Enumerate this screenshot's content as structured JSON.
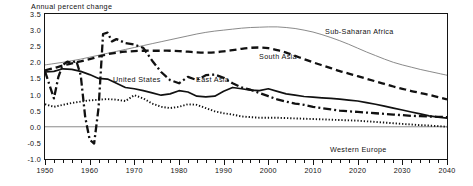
{
  "axis_title": "Annual percent change",
  "yticks": [
    "3.5",
    "3.0",
    "2.5",
    "2.0",
    "1.5",
    "1.0",
    "0.5",
    "0.0",
    "-0.5",
    "-1.0"
  ],
  "xticks": [
    "1950",
    "1960",
    "1970",
    "1980",
    "1990",
    "2000",
    "2010",
    "2020",
    "2030",
    "2040"
  ],
  "labels": {
    "sub_saharan_africa": "Sub-Saharan Africa",
    "south_asia": "South Asia",
    "east_asia": "East Asia",
    "united_states": "United States",
    "western_europe": "Western Europe"
  },
  "colors": {
    "frame": "#141414",
    "zero_line": "#8a8a8a",
    "sub_saharan_africa": "#7d7d7d",
    "south_asia": "#111111",
    "east_asia": "#111111",
    "united_states": "#111111",
    "western_europe": "#111111"
  },
  "chart_data": {
    "type": "line",
    "title": "",
    "xlabel": "",
    "ylabel": "Annual percent change",
    "xlim": [
      1950,
      2040
    ],
    "ylim": [
      -1.0,
      3.5
    ],
    "ytick_values": [
      3.5,
      3.0,
      2.5,
      2.0,
      1.5,
      1.0,
      0.5,
      0.0,
      -0.5,
      -1.0
    ],
    "xtick_values": [
      1950,
      1960,
      1970,
      1980,
      1990,
      2000,
      2010,
      2020,
      2030,
      2040
    ],
    "grid": false,
    "legend": "inline-annotations",
    "series": [
      {
        "name": "Sub-Saharan Africa",
        "style": "thin-solid-gray",
        "x": [
          1950,
          1952,
          1954,
          1956,
          1958,
          1960,
          1962,
          1964,
          1966,
          1968,
          1970,
          1972,
          1974,
          1976,
          1978,
          1980,
          1982,
          1984,
          1986,
          1988,
          1990,
          1992,
          1994,
          1996,
          1998,
          2000,
          2002,
          2004,
          2006,
          2008,
          2010,
          2012,
          2014,
          2016,
          2018,
          2020,
          2022,
          2024,
          2026,
          2028,
          2030,
          2032,
          2034,
          2036,
          2038,
          2040
        ],
        "values": [
          1.92,
          1.96,
          2.0,
          2.05,
          2.1,
          2.16,
          2.22,
          2.28,
          2.34,
          2.4,
          2.46,
          2.52,
          2.58,
          2.64,
          2.7,
          2.76,
          2.82,
          2.88,
          2.93,
          2.97,
          3.0,
          3.03,
          3.06,
          3.08,
          3.09,
          3.1,
          3.1,
          3.08,
          3.05,
          3.0,
          2.94,
          2.86,
          2.77,
          2.67,
          2.56,
          2.44,
          2.32,
          2.21,
          2.1,
          2.0,
          1.92,
          1.85,
          1.78,
          1.72,
          1.66,
          1.6
        ]
      },
      {
        "name": "South Asia",
        "style": "heavy-dashed",
        "x": [
          1950,
          1952,
          1954,
          1956,
          1958,
          1960,
          1962,
          1964,
          1966,
          1968,
          1970,
          1972,
          1974,
          1976,
          1978,
          1980,
          1982,
          1984,
          1986,
          1988,
          1990,
          1992,
          1994,
          1996,
          1998,
          2000,
          2002,
          2004,
          2006,
          2008,
          2010,
          2012,
          2014,
          2016,
          2018,
          2020,
          2022,
          2024,
          2026,
          2028,
          2030,
          2032,
          2034,
          2036,
          2038,
          2040
        ],
        "values": [
          1.75,
          1.82,
          1.9,
          1.97,
          2.03,
          2.1,
          2.18,
          2.25,
          2.3,
          2.33,
          2.35,
          2.36,
          2.36,
          2.36,
          2.36,
          2.35,
          2.33,
          2.31,
          2.3,
          2.31,
          2.34,
          2.38,
          2.42,
          2.45,
          2.46,
          2.44,
          2.38,
          2.3,
          2.2,
          2.1,
          2.0,
          1.91,
          1.82,
          1.73,
          1.65,
          1.57,
          1.49,
          1.41,
          1.33,
          1.25,
          1.18,
          1.11,
          1.05,
          0.99,
          0.92,
          0.85
        ]
      },
      {
        "name": "East Asia",
        "style": "heavy-dash-dot",
        "x": [
          1950,
          1951,
          1952,
          1953,
          1954,
          1955,
          1956,
          1957,
          1958,
          1959,
          1960,
          1961,
          1962,
          1963,
          1964,
          1965,
          1966,
          1968,
          1970,
          1972,
          1974,
          1976,
          1978,
          1980,
          1982,
          1984,
          1986,
          1988,
          1990,
          1992,
          1994,
          1996,
          1998,
          2000,
          2002,
          2004,
          2006,
          2008,
          2010,
          2012,
          2014,
          2016,
          2018,
          2020,
          2022,
          2024,
          2026,
          2028,
          2030,
          2032,
          2034,
          2036,
          2038,
          2040
        ],
        "values": [
          1.72,
          1.3,
          0.88,
          1.55,
          1.92,
          2.02,
          1.98,
          2.05,
          1.6,
          0.3,
          -0.4,
          -0.52,
          0.6,
          2.88,
          2.92,
          2.65,
          2.72,
          2.6,
          2.55,
          2.45,
          2.05,
          1.7,
          1.45,
          1.35,
          1.55,
          1.45,
          1.6,
          1.62,
          1.52,
          1.35,
          1.22,
          1.15,
          1.05,
          0.95,
          0.85,
          0.78,
          0.72,
          0.68,
          0.62,
          0.58,
          0.54,
          0.5,
          0.48,
          0.46,
          0.44,
          0.42,
          0.4,
          0.38,
          0.36,
          0.34,
          0.33,
          0.32,
          0.31,
          0.3
        ]
      },
      {
        "name": "United States",
        "style": "medium-solid",
        "x": [
          1950,
          1952,
          1954,
          1956,
          1958,
          1960,
          1962,
          1964,
          1966,
          1968,
          1970,
          1972,
          1974,
          1976,
          1978,
          1980,
          1982,
          1984,
          1986,
          1988,
          1990,
          1992,
          1994,
          1996,
          1998,
          2000,
          2002,
          2004,
          2006,
          2008,
          2010,
          2012,
          2014,
          2016,
          2018,
          2020,
          2022,
          2024,
          2026,
          2028,
          2030,
          2032,
          2034,
          2036,
          2038,
          2040
        ],
        "values": [
          1.7,
          1.72,
          1.8,
          1.78,
          1.72,
          1.62,
          1.5,
          1.48,
          1.35,
          1.22,
          1.18,
          1.12,
          1.05,
          0.98,
          1.02,
          1.12,
          1.08,
          0.95,
          0.93,
          0.95,
          1.1,
          1.22,
          1.18,
          1.14,
          1.12,
          1.18,
          1.1,
          1.02,
          0.98,
          0.94,
          0.92,
          0.9,
          0.88,
          0.86,
          0.83,
          0.8,
          0.75,
          0.7,
          0.64,
          0.58,
          0.52,
          0.46,
          0.4,
          0.34,
          0.3,
          0.27
        ]
      },
      {
        "name": "Western Europe",
        "style": "dotted",
        "x": [
          1950,
          1952,
          1954,
          1956,
          1958,
          1960,
          1962,
          1964,
          1966,
          1968,
          1970,
          1972,
          1974,
          1976,
          1978,
          1980,
          1982,
          1984,
          1986,
          1988,
          1990,
          1992,
          1994,
          1996,
          1998,
          2000,
          2002,
          2004,
          2006,
          2008,
          2010,
          2012,
          2014,
          2016,
          2018,
          2020,
          2022,
          2024,
          2026,
          2028,
          2030,
          2032,
          2034,
          2036,
          2038,
          2040
        ],
        "values": [
          0.7,
          0.62,
          0.68,
          0.74,
          0.78,
          0.82,
          0.84,
          0.86,
          0.84,
          0.8,
          0.98,
          0.88,
          0.72,
          0.62,
          0.58,
          0.62,
          0.7,
          0.68,
          0.58,
          0.48,
          0.42,
          0.38,
          0.32,
          0.3,
          0.28,
          0.28,
          0.28,
          0.27,
          0.26,
          0.25,
          0.24,
          0.23,
          0.22,
          0.21,
          0.2,
          0.19,
          0.17,
          0.15,
          0.13,
          0.11,
          0.09,
          0.07,
          0.05,
          0.04,
          0.02,
          0.0
        ]
      }
    ]
  }
}
